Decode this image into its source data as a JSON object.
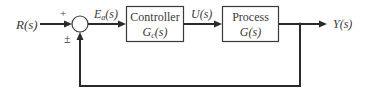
{
  "diagram": {
    "type": "closed-loop feedback block diagram",
    "input": {
      "label": "R(s)"
    },
    "summing_junction": {
      "plus_sign": "+",
      "feedback_sign": "±"
    },
    "error_signal": {
      "label_main": "E",
      "label_sub": "a",
      "label_tail": "(s)"
    },
    "controller": {
      "title": "Controller",
      "tf_main": "G",
      "tf_sub": "c",
      "tf_tail": "(s)"
    },
    "control_signal": {
      "label": "U(s)"
    },
    "process": {
      "title": "Process",
      "tf": "G(s)"
    },
    "output": {
      "label": "Y(s)"
    },
    "colors": {
      "line": "#2a2a2a",
      "text": "#3a3a3a",
      "background": "#ffffff"
    }
  }
}
